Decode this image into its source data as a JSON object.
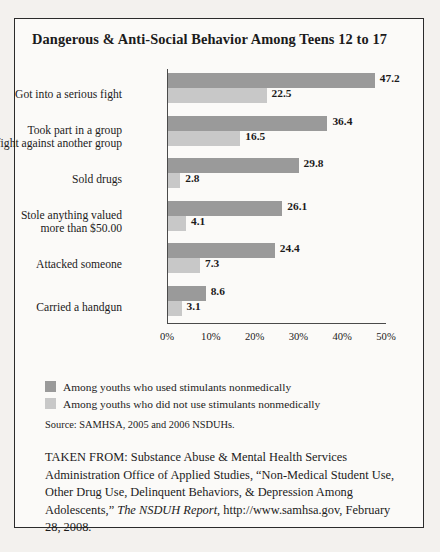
{
  "title": "Dangerous & Anti-Social Behavior Among Teens 12 to 17",
  "chart_data": {
    "type": "bar",
    "orientation": "horizontal",
    "title": "Dangerous & Anti-Social Behavior Among Teens 12 to 17",
    "xlabel": "",
    "ylabel": "",
    "xlim": [
      0,
      50
    ],
    "grid": false,
    "legend_position": "below-plot",
    "tick_labels": [
      "0%",
      "10%",
      "20%",
      "30%",
      "40%",
      "50%"
    ],
    "tick_values": [
      0,
      10,
      20,
      30,
      40,
      50
    ],
    "categories": [
      "Got into a serious fight",
      "Took part in a group\nfight against another group",
      "Sold drugs",
      "Stole anything valued\nmore than $50.00",
      "Attacked someone",
      "Carried a handgun"
    ],
    "series": [
      {
        "name": "Among youths who used stimulants nonmedically",
        "color": "#9a9a9a",
        "values": [
          47.2,
          36.4,
          29.8,
          26.1,
          24.4,
          8.6
        ]
      },
      {
        "name": "Among youths who did not use stimulants nonmedically",
        "color": "#c8c8c8",
        "values": [
          22.5,
          16.5,
          2.8,
          4.1,
          7.3,
          3.1
        ]
      }
    ]
  },
  "legend": [
    {
      "label": "Among youths who used stimulants nonmedically",
      "swatch": "used"
    },
    {
      "label": "Among youths who did not use stimulants nonmedically",
      "swatch": "notused"
    }
  ],
  "source": "Source: SAMHSA, 2005 and 2006 NSDUHs.",
  "taken_from": {
    "part1": "TAKEN FROM: Substance Abuse & Mental Health Services Administration Office of Applied Studies, “Non-Medical Student Use, Other Drug Use, Delinquent Behaviors, & Depression Among Adolescents,” ",
    "italic": "The NSDUH Report",
    "part2": ", http://www.samhsa.gov, February 28, 2008."
  }
}
